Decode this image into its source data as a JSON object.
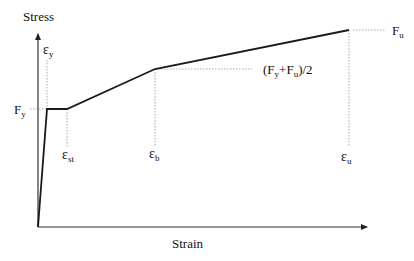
{
  "diagram": {
    "type": "stress-strain-curve",
    "axes": {
      "y_label": "Stress",
      "x_label": "Strain"
    },
    "stress_labels": {
      "fy": {
        "main": "F",
        "sub": "y"
      },
      "fu": {
        "main": "F",
        "sub": "u"
      },
      "mid": {
        "open": "(F",
        "sub1": "y",
        "plus": "+F",
        "sub2": "u",
        "close": ")/2"
      }
    },
    "strain_labels": {
      "ey": {
        "main": "ε",
        "sub": "y"
      },
      "est": {
        "main": "ε",
        "sub": "st"
      },
      "eb": {
        "main": "ε",
        "sub": "b"
      },
      "eu": {
        "main": "ε",
        "sub": "u"
      }
    },
    "curve_points": [
      {
        "name": "origin",
        "strain": "0",
        "stress": "0"
      },
      {
        "name": "yield",
        "strain": "ε_y",
        "stress": "F_y"
      },
      {
        "name": "strain-hardening-start",
        "strain": "ε_st",
        "stress": "F_y"
      },
      {
        "name": "break-point",
        "strain": "ε_b",
        "stress": "(F_y+F_u)/2"
      },
      {
        "name": "ultimate",
        "strain": "ε_u",
        "stress": "F_u"
      }
    ],
    "colors": {
      "curve": "#1a1a1a",
      "axis": "#333333",
      "guide": "#aaaaaa"
    }
  }
}
